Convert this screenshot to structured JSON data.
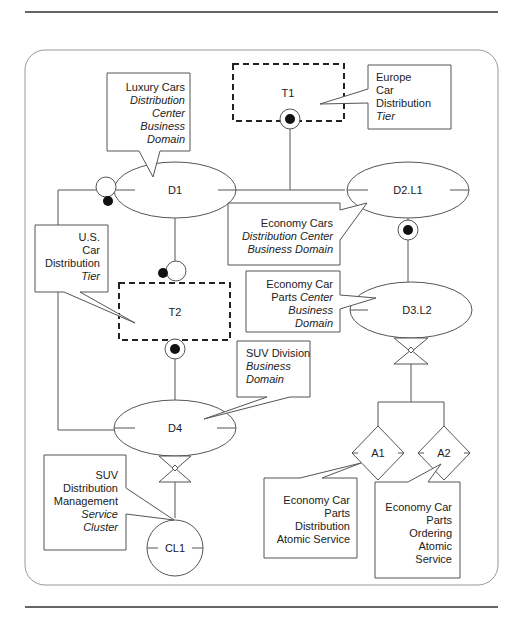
{
  "diagram": {
    "nodes": {
      "d1": "D1",
      "d2l1": "D2.L1",
      "d3l2": "D3.L2",
      "d4": "D4",
      "t1": "T1",
      "t2": "T2",
      "cl1": "CL1",
      "a1": "A1",
      "a2": "A2"
    },
    "callouts": {
      "luxury": [
        "Luxury Cars",
        "Distribution",
        "Center",
        "Business",
        "Domain"
      ],
      "europe": [
        "Europe",
        "Car",
        "Distribution",
        "Tier"
      ],
      "us": [
        "U.S.",
        "Car",
        "Distribution",
        "Tier"
      ],
      "economy_cars": [
        "Economy Cars",
        "Distribution Center",
        "Business Domain"
      ],
      "economy_parts": [
        "Economy Car",
        "Parts Center",
        "Business",
        "Domain"
      ],
      "suv_division": [
        "SUV Division",
        "Business",
        "Domain"
      ],
      "suv_mgmt": [
        "SUV",
        "Distribution",
        "Management",
        "Service",
        "Cluster"
      ],
      "a1_desc": [
        "Economy Car",
        "Parts",
        "Distribution",
        "Atomic Service"
      ],
      "a2_desc": [
        "Economy Car",
        "Parts",
        "Ordering",
        "Atomic",
        "Service"
      ]
    }
  }
}
